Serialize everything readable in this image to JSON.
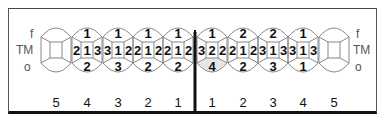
{
  "surface_labels": {
    "top": "f",
    "middle": "TM",
    "bottom": "o"
  },
  "left_quadrant": {
    "tooth_numbers": [
      "5",
      "4",
      "3",
      "2",
      "1"
    ],
    "teeth": [
      {
        "number": "5",
        "top": "",
        "left": "",
        "center": "",
        "right": "",
        "bottom": "",
        "shaded": false
      },
      {
        "number": "4",
        "top": "1",
        "left": "2",
        "center": "1",
        "right": "3",
        "bottom": "2",
        "shaded": false
      },
      {
        "number": "3",
        "top": "1",
        "left": "3",
        "center": "1",
        "right": "2",
        "bottom": "3",
        "shaded": false
      },
      {
        "number": "2",
        "top": "1",
        "left": "2",
        "center": "1",
        "right": "2",
        "bottom": "2",
        "shaded": false
      },
      {
        "number": "1",
        "top": "1",
        "left": "2",
        "center": "1",
        "right": "2",
        "bottom": "2",
        "shaded": false
      }
    ]
  },
  "right_quadrant": {
    "tooth_numbers": [
      "1",
      "2",
      "3",
      "4",
      "5"
    ],
    "teeth": [
      {
        "number": "1",
        "top": "1",
        "left": "3",
        "center": "2",
        "right": "2",
        "bottom": "4",
        "shaded": true
      },
      {
        "number": "2",
        "top": "2",
        "left": "2",
        "center": "1",
        "right": "2",
        "bottom": "2",
        "shaded": false
      },
      {
        "number": "3",
        "top": "2",
        "left": "3",
        "center": "1",
        "right": "3",
        "bottom": "3",
        "shaded": false
      },
      {
        "number": "4",
        "top": "1",
        "left": "3",
        "center": "1",
        "right": "3",
        "bottom": "1",
        "shaded": false
      },
      {
        "number": "5",
        "top": "",
        "left": "",
        "center": "",
        "right": "",
        "bottom": "",
        "shaded": false
      }
    ]
  },
  "colors": {
    "line": "#888888",
    "text": "#111111",
    "shade": "#e6e6e6",
    "divider": "#111111"
  }
}
